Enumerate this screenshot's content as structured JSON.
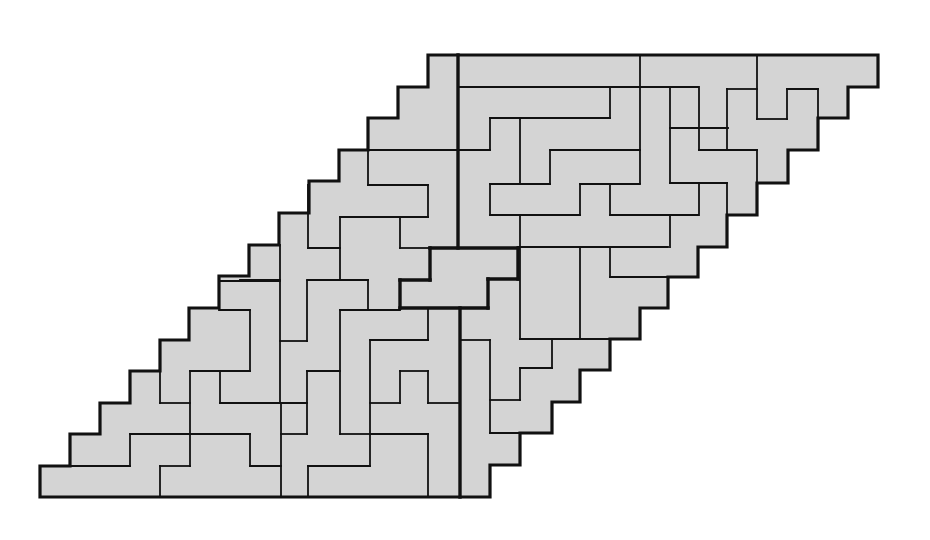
{
  "figure": {
    "type": "polyomino-tiling",
    "grid": {
      "rows": 14,
      "cells_per_row": 15,
      "row_shift": 1
    },
    "colors": {
      "fill": "#d4d4d4",
      "stroke": "#111111",
      "background": "#ffffff"
    },
    "outline": [
      [
        428,
        55
      ],
      [
        878,
        55
      ],
      [
        878,
        87
      ],
      [
        848,
        87
      ],
      [
        848,
        118
      ],
      [
        818,
        118
      ],
      [
        818,
        150
      ],
      [
        788,
        150
      ],
      [
        788,
        183
      ],
      [
        757,
        183
      ],
      [
        757,
        215
      ],
      [
        727,
        215
      ],
      [
        727,
        247
      ],
      [
        698,
        247
      ],
      [
        698,
        277
      ],
      [
        668,
        277
      ],
      [
        668,
        308
      ],
      [
        640,
        308
      ],
      [
        640,
        339
      ],
      [
        610,
        339
      ],
      [
        610,
        370
      ],
      [
        580,
        370
      ],
      [
        580,
        402
      ],
      [
        552,
        402
      ],
      [
        552,
        433
      ],
      [
        520,
        433
      ],
      [
        520,
        465
      ],
      [
        490,
        465
      ],
      [
        490,
        497
      ],
      [
        40,
        497
      ],
      [
        40,
        466
      ],
      [
        70,
        466
      ],
      [
        70,
        434
      ],
      [
        100,
        434
      ],
      [
        100,
        403
      ],
      [
        130,
        403
      ],
      [
        130,
        371
      ],
      [
        160,
        371
      ],
      [
        160,
        340
      ],
      [
        189,
        340
      ],
      [
        189,
        308
      ],
      [
        219,
        308
      ],
      [
        219,
        276
      ],
      [
        249,
        276
      ],
      [
        249,
        245
      ],
      [
        279,
        245
      ],
      [
        279,
        213
      ],
      [
        309,
        213
      ],
      [
        309,
        181
      ],
      [
        339,
        181
      ],
      [
        339,
        150
      ],
      [
        368,
        150
      ],
      [
        368,
        118
      ],
      [
        398,
        118
      ],
      [
        398,
        87
      ],
      [
        428,
        87
      ]
    ],
    "thick_segments": [
      [
        [
          458,
          55
        ],
        [
          458,
          248
        ]
      ],
      [
        [
          430,
          248
        ],
        [
          518,
          248
        ]
      ],
      [
        [
          430,
          248
        ],
        [
          430,
          280
        ]
      ],
      [
        [
          400,
          280
        ],
        [
          430,
          280
        ]
      ],
      [
        [
          400,
          280
        ],
        [
          400,
          308
        ]
      ],
      [
        [
          400,
          308
        ],
        [
          488,
          308
        ]
      ],
      [
        [
          488,
          279
        ],
        [
          488,
          308
        ]
      ],
      [
        [
          488,
          279
        ],
        [
          518,
          279
        ]
      ],
      [
        [
          518,
          248
        ],
        [
          518,
          279
        ]
      ],
      [
        [
          460,
          308
        ],
        [
          460,
          497
        ]
      ]
    ],
    "thin_segments": [
      [
        [
          458,
          87
        ],
        [
          699,
          87
        ]
      ],
      [
        [
          640,
          55
        ],
        [
          640,
          183
        ]
      ],
      [
        [
          757,
          55
        ],
        [
          757,
          119
        ]
      ],
      [
        [
          727,
          89
        ],
        [
          757,
          89
        ]
      ],
      [
        [
          757,
          119
        ],
        [
          787,
          119
        ]
      ],
      [
        [
          787,
          89
        ],
        [
          787,
          119
        ]
      ],
      [
        [
          787,
          89
        ],
        [
          818,
          89
        ]
      ],
      [
        [
          818,
          89
        ],
        [
          818,
          119
        ]
      ],
      [
        [
          727,
          89
        ],
        [
          727,
          150
        ]
      ],
      [
        [
          699,
          89
        ],
        [
          699,
          150
        ]
      ],
      [
        [
          699,
          150
        ],
        [
          757,
          150
        ]
      ],
      [
        [
          757,
          150
        ],
        [
          757,
          183
        ]
      ],
      [
        [
          670,
          89
        ],
        [
          670,
          183
        ]
      ],
      [
        [
          670,
          183
        ],
        [
          727,
          183
        ]
      ],
      [
        [
          727,
          183
        ],
        [
          727,
          215
        ]
      ],
      [
        [
          699,
          183
        ],
        [
          699,
          215
        ]
      ],
      [
        [
          610,
          215
        ],
        [
          698,
          215
        ]
      ],
      [
        [
          610,
          184
        ],
        [
          610,
          215
        ]
      ],
      [
        [
          670,
          128
        ],
        [
          728,
          128
        ]
      ],
      [
        [
          610,
          89
        ],
        [
          610,
          118
        ]
      ],
      [
        [
          490,
          118
        ],
        [
          610,
          118
        ]
      ],
      [
        [
          490,
          118
        ],
        [
          490,
          150
        ]
      ],
      [
        [
          458,
          150
        ],
        [
          490,
          150
        ]
      ],
      [
        [
          520,
          118
        ],
        [
          520,
          184
        ]
      ],
      [
        [
          550,
          150
        ],
        [
          640,
          150
        ]
      ],
      [
        [
          550,
          150
        ],
        [
          550,
          184
        ]
      ],
      [
        [
          490,
          184
        ],
        [
          550,
          184
        ]
      ],
      [
        [
          580,
          184
        ],
        [
          640,
          184
        ]
      ],
      [
        [
          490,
          184
        ],
        [
          490,
          215
        ]
      ],
      [
        [
          580,
          184
        ],
        [
          580,
          215
        ]
      ],
      [
        [
          490,
          215
        ],
        [
          580,
          215
        ]
      ],
      [
        [
          520,
          215
        ],
        [
          520,
          247
        ]
      ],
      [
        [
          670,
          215
        ],
        [
          670,
          247
        ]
      ],
      [
        [
          518,
          247
        ],
        [
          668,
          247
        ]
      ],
      [
        [
          520,
          247
        ],
        [
          520,
          339
        ]
      ],
      [
        [
          580,
          247
        ],
        [
          580,
          339
        ]
      ],
      [
        [
          610,
          247
        ],
        [
          610,
          277
        ]
      ],
      [
        [
          610,
          277
        ],
        [
          668,
          277
        ]
      ],
      [
        [
          520,
          339
        ],
        [
          640,
          339
        ]
      ],
      [
        [
          460,
          340
        ],
        [
          490,
          340
        ]
      ],
      [
        [
          490,
          340
        ],
        [
          490,
          433
        ]
      ],
      [
        [
          552,
          339
        ],
        [
          552,
          368
        ]
      ],
      [
        [
          520,
          368
        ],
        [
          552,
          368
        ]
      ],
      [
        [
          520,
          368
        ],
        [
          520,
          400
        ]
      ],
      [
        [
          490,
          400
        ],
        [
          520,
          400
        ]
      ],
      [
        [
          490,
          433
        ],
        [
          552,
          433
        ]
      ],
      [
        [
          368,
          150
        ],
        [
          458,
          150
        ]
      ],
      [
        [
          368,
          150
        ],
        [
          368,
          185
        ]
      ],
      [
        [
          368,
          185
        ],
        [
          428,
          185
        ]
      ],
      [
        [
          428,
          185
        ],
        [
          428,
          217
        ]
      ],
      [
        [
          340,
          217
        ],
        [
          428,
          217
        ]
      ],
      [
        [
          308,
          185
        ],
        [
          308,
          248
        ]
      ],
      [
        [
          308,
          248
        ],
        [
          340,
          248
        ]
      ],
      [
        [
          340,
          217
        ],
        [
          340,
          280
        ]
      ],
      [
        [
          400,
          217
        ],
        [
          400,
          248
        ]
      ],
      [
        [
          400,
          248
        ],
        [
          430,
          248
        ]
      ],
      [
        [
          330,
          280
        ],
        [
          368,
          280
        ]
      ],
      [
        [
          368,
          280
        ],
        [
          368,
          310
        ]
      ],
      [
        [
          340,
          310
        ],
        [
          400,
          310
        ]
      ],
      [
        [
          340,
          310
        ],
        [
          340,
          371
        ]
      ],
      [
        [
          428,
          310
        ],
        [
          428,
          340
        ]
      ],
      [
        [
          370,
          340
        ],
        [
          428,
          340
        ]
      ],
      [
        [
          370,
          340
        ],
        [
          370,
          466
        ]
      ],
      [
        [
          280,
          245
        ],
        [
          280,
          280
        ]
      ],
      [
        [
          240,
          280
        ],
        [
          280,
          280
        ]
      ],
      [
        [
          307,
          280
        ],
        [
          368,
          280
        ]
      ],
      [
        [
          220,
          281
        ],
        [
          280,
          281
        ]
      ],
      [
        [
          280,
          281
        ],
        [
          280,
          403
        ]
      ],
      [
        [
          307,
          281
        ],
        [
          307,
          341
        ]
      ],
      [
        [
          280,
          341
        ],
        [
          307,
          341
        ]
      ],
      [
        [
          219,
          310
        ],
        [
          250,
          310
        ]
      ],
      [
        [
          250,
          310
        ],
        [
          250,
          371
        ]
      ],
      [
        [
          190,
          371
        ],
        [
          250,
          371
        ]
      ],
      [
        [
          160,
          340
        ],
        [
          160,
          403
        ]
      ],
      [
        [
          190,
          371
        ],
        [
          190,
          466
        ]
      ],
      [
        [
          220,
          371
        ],
        [
          220,
          403
        ]
      ],
      [
        [
          220,
          403
        ],
        [
          307,
          403
        ]
      ],
      [
        [
          307,
          371
        ],
        [
          340,
          371
        ]
      ],
      [
        [
          307,
          371
        ],
        [
          307,
          434
        ]
      ],
      [
        [
          340,
          371
        ],
        [
          340,
          434
        ]
      ],
      [
        [
          340,
          434
        ],
        [
          370,
          434
        ]
      ],
      [
        [
          400,
          371
        ],
        [
          400,
          403
        ]
      ],
      [
        [
          370,
          403
        ],
        [
          400,
          403
        ]
      ],
      [
        [
          400,
          371
        ],
        [
          428,
          371
        ]
      ],
      [
        [
          428,
          371
        ],
        [
          428,
          403
        ]
      ],
      [
        [
          428,
          403
        ],
        [
          458,
          403
        ]
      ],
      [
        [
          370,
          434
        ],
        [
          428,
          434
        ]
      ],
      [
        [
          428,
          434
        ],
        [
          428,
          497
        ]
      ],
      [
        [
          160,
          403
        ],
        [
          190,
          403
        ]
      ],
      [
        [
          130,
          434
        ],
        [
          250,
          434
        ]
      ],
      [
        [
          130,
          434
        ],
        [
          130,
          466
        ]
      ],
      [
        [
          70,
          466
        ],
        [
          130,
          466
        ]
      ],
      [
        [
          250,
          434
        ],
        [
          250,
          466
        ]
      ],
      [
        [
          250,
          466
        ],
        [
          281,
          466
        ]
      ],
      [
        [
          281,
          403
        ],
        [
          281,
          497
        ]
      ],
      [
        [
          281,
          434
        ],
        [
          307,
          434
        ]
      ],
      [
        [
          160,
          466
        ],
        [
          190,
          466
        ]
      ],
      [
        [
          160,
          466
        ],
        [
          160,
          497
        ]
      ],
      [
        [
          308,
          466
        ],
        [
          370,
          466
        ]
      ],
      [
        [
          308,
          466
        ],
        [
          308,
          497
        ]
      ]
    ]
  }
}
